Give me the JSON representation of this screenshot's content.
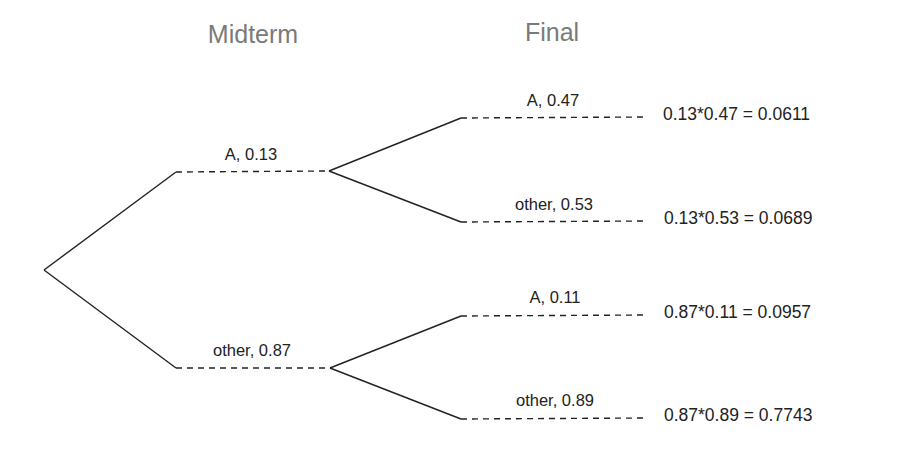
{
  "headers": {
    "midterm": "Midterm",
    "final": "Final"
  },
  "midterm_branches": [
    {
      "outcome": "A",
      "prob": "0.13",
      "label": "A,  0.13"
    },
    {
      "outcome": "other",
      "prob": "0.87",
      "label": "other,  0.87"
    }
  ],
  "final_branches": [
    {
      "parent": "A",
      "outcome": "A",
      "prob": "0.47",
      "label": "A,  0.47",
      "result": "0.13*0.47 = 0.0611"
    },
    {
      "parent": "A",
      "outcome": "other",
      "prob": "0.53",
      "label": "other,  0.53",
      "result": "0.13*0.53 = 0.0689"
    },
    {
      "parent": "other",
      "outcome": "A",
      "prob": "0.11",
      "label": "A,  0.11",
      "result": "0.87*0.11 = 0.0957"
    },
    {
      "parent": "other",
      "outcome": "other",
      "prob": "0.89",
      "label": "other,  0.89",
      "result": "0.87*0.89 = 0.7743"
    }
  ],
  "colors": {
    "line": "#222222",
    "header": "#7a7a7a",
    "text": "#222222"
  }
}
